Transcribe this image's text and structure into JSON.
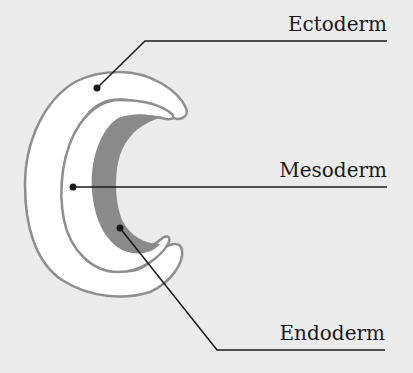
{
  "diagram": {
    "labels": [
      {
        "id": "ectoderm",
        "text": "Ectoderm"
      },
      {
        "id": "mesoderm",
        "text": "Mesoderm"
      },
      {
        "id": "endoderm",
        "text": "Endoderm"
      }
    ],
    "colors": {
      "background": "#ebebeb",
      "outline": "#8e8e8e",
      "layer_fill": "#ffffff",
      "endoderm_fill": "#8a8a8a",
      "leader": "#1a1a1a"
    }
  }
}
